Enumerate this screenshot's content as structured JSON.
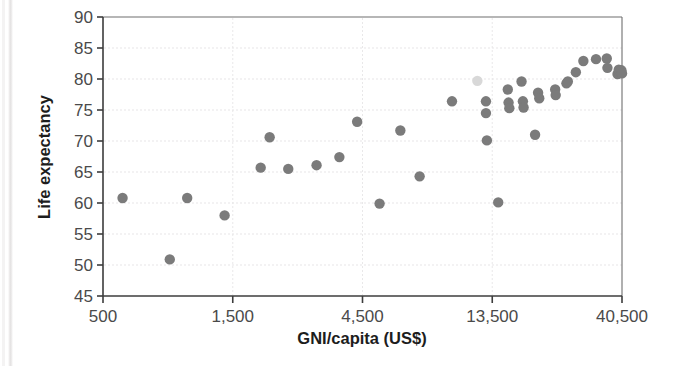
{
  "chart_data": {
    "type": "scatter",
    "title": "",
    "xlabel": "GNI/capita (US$)",
    "ylabel": "Life expectancy",
    "xscale": "log",
    "log_base": 3,
    "xlim": [
      500,
      40500
    ],
    "ylim": [
      45,
      90
    ],
    "xticks": [
      500,
      1500,
      4500,
      13500,
      40500
    ],
    "xtick_labels": [
      "500",
      "1,500",
      "4,500",
      "13,500",
      "40,500"
    ],
    "yticks": [
      45,
      50,
      55,
      60,
      65,
      70,
      75,
      80,
      85,
      90
    ],
    "ytick_labels": [
      "45",
      "50",
      "55",
      "60",
      "65",
      "70",
      "75",
      "80",
      "85",
      "90"
    ],
    "grid": true,
    "legend": "none",
    "marker_color": "#7b7b7b",
    "marker_size": 5.2,
    "points": [
      {
        "x": 590,
        "y": 60.8
      },
      {
        "x": 880,
        "y": 50.9
      },
      {
        "x": 1020,
        "y": 60.8
      },
      {
        "x": 1400,
        "y": 58.0
      },
      {
        "x": 1900,
        "y": 65.7
      },
      {
        "x": 2050,
        "y": 70.6
      },
      {
        "x": 2400,
        "y": 65.5
      },
      {
        "x": 3050,
        "y": 66.1
      },
      {
        "x": 3700,
        "y": 67.4
      },
      {
        "x": 4300,
        "y": 73.1
      },
      {
        "x": 5200,
        "y": 59.9
      },
      {
        "x": 6200,
        "y": 71.7
      },
      {
        "x": 7300,
        "y": 64.3
      },
      {
        "x": 9600,
        "y": 76.4
      },
      {
        "x": 11900,
        "y": 79.7,
        "faint": true
      },
      {
        "x": 12800,
        "y": 76.4
      },
      {
        "x": 12800,
        "y": 74.5
      },
      {
        "x": 12900,
        "y": 70.1
      },
      {
        "x": 14200,
        "y": 60.1
      },
      {
        "x": 15400,
        "y": 78.3
      },
      {
        "x": 15500,
        "y": 76.2
      },
      {
        "x": 15600,
        "y": 75.3
      },
      {
        "x": 17300,
        "y": 79.6
      },
      {
        "x": 17500,
        "y": 76.4
      },
      {
        "x": 17600,
        "y": 75.4
      },
      {
        "x": 19400,
        "y": 71.0
      },
      {
        "x": 19900,
        "y": 77.8
      },
      {
        "x": 20100,
        "y": 76.9
      },
      {
        "x": 23000,
        "y": 78.3
      },
      {
        "x": 23100,
        "y": 77.4
      },
      {
        "x": 25300,
        "y": 79.3
      },
      {
        "x": 25600,
        "y": 79.6
      },
      {
        "x": 27400,
        "y": 81.1
      },
      {
        "x": 29200,
        "y": 82.9
      },
      {
        "x": 32500,
        "y": 83.2
      },
      {
        "x": 35600,
        "y": 83.3
      },
      {
        "x": 35800,
        "y": 81.8
      },
      {
        "x": 39000,
        "y": 80.8
      },
      {
        "x": 39400,
        "y": 81.5
      },
      {
        "x": 40000,
        "y": 81.2
      },
      {
        "x": 40300,
        "y": 81.4
      },
      {
        "x": 40500,
        "y": 80.9
      }
    ]
  }
}
